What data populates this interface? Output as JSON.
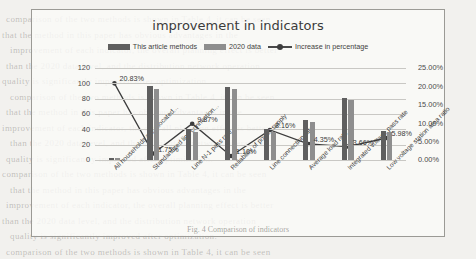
{
  "chart_data": {
    "type": "bar",
    "title": "improvement in indicators",
    "xlabel": "",
    "ylabel": "",
    "ylim": [
      0,
      120
    ],
    "y2lim": [
      0,
      25
    ],
    "grid": true,
    "legend_position": "top-center",
    "categories": [
      "All households are allocated...",
      "Standardized line connection...",
      "Line N-1 pass rate",
      "Reliability of power supply",
      "Line connection rate",
      "Average load rate",
      "Integrated voltage pass rate",
      "Low voltage station area ratio"
    ],
    "left_ticks": [
      "0",
      "20",
      "40",
      "60",
      "80",
      "100",
      "120"
    ],
    "right_ticks": [
      "0.00%",
      "5.00%",
      "10.00%",
      "15.00%",
      "20.00%",
      "25.00%"
    ],
    "series": [
      {
        "name": "This article methods",
        "type": "bar",
        "color": "#5f5f5f",
        "axis": "left",
        "values": [
          2.4,
          96,
          40,
          95,
          40,
          52,
          81,
          38
        ]
      },
      {
        "name": "2020 data",
        "type": "bar",
        "color": "#8e8e8e",
        "axis": "left",
        "values": [
          2.0,
          93,
          37,
          93,
          37,
          50,
          78,
          36
        ]
      },
      {
        "name": "Increase in percentage",
        "type": "line",
        "color": "#3d3d3d",
        "axis": "right",
        "values": [
          20.83,
          1.75,
          9.87,
          1.1,
          8.16,
          4.35,
          3.66,
          5.98
        ],
        "labels": [
          "20.83%",
          "1.75%",
          "9.87%",
          "1.10%",
          "8.16%",
          "4.35%",
          "3.66%",
          "5.98%"
        ]
      }
    ]
  },
  "page": {
    "caption": "Fig. 4 Comparison of indicators",
    "background_lines": [
      "comparison of the two methods is shown in Table 4, it can be seen",
      "that the method in this paper has obvious advantages in the",
      "improvement of each indicator, the overall planning effect is better",
      "than the 2020 data level, and the distribution network operation",
      "quality is significantly improved after optimization."
    ]
  }
}
